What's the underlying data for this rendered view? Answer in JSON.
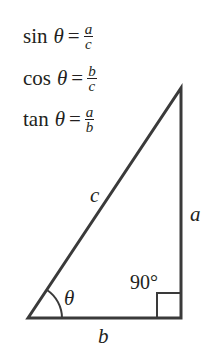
{
  "formulas": [
    {
      "fn": "sin",
      "angle": "θ",
      "eq": "=",
      "numerator": "a",
      "denominator": "c"
    },
    {
      "fn": "cos",
      "angle": "θ",
      "eq": "=",
      "numerator": "b",
      "denominator": "c"
    },
    {
      "fn": "tan",
      "angle": "θ",
      "eq": "=",
      "numerator": "a",
      "denominator": "b"
    }
  ],
  "triangle": {
    "vertices": {
      "bottom_left": [
        28,
        318
      ],
      "apex": [
        181,
        88
      ],
      "right_angle": [
        181,
        318
      ]
    },
    "stroke_color": "#3a3a3a",
    "labels": {
      "hypotenuse": "c",
      "opposite": "a",
      "adjacent": "b",
      "angle": "θ",
      "right_angle": "90°"
    }
  }
}
